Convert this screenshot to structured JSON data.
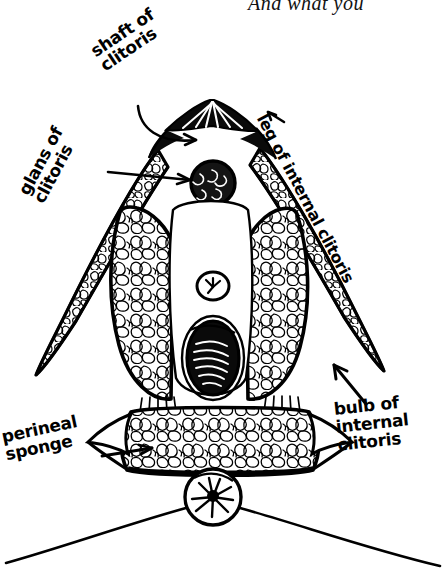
{
  "caption": {
    "text": "And what you"
  },
  "illustration": {
    "title": "internal clitoris anatomy diagram",
    "style": "hand-drawn black ink line art",
    "background_color": "#ffffff",
    "ink_color": "#000000"
  },
  "labels": [
    {
      "id": "shaft",
      "text": "shaft of\nclitoris",
      "pointer": "curved-line-arrow",
      "points_to": "clitoral shaft at apex"
    },
    {
      "id": "glans",
      "text": "glans of\nclitoris",
      "pointer": "straight-line-arrow",
      "points_to": "glans blob"
    },
    {
      "id": "leg",
      "text": "leg of internal clitoris",
      "pointer": "short-arrow",
      "points_to": "crus / leg"
    },
    {
      "id": "bulb",
      "text": "bulb of\ninternal\nclitoris",
      "pointer": "diagonal-arrow",
      "points_to": "vestibular bulb"
    },
    {
      "id": "perineal",
      "text": "perineal\nsponge",
      "pointer": "horizontal-arrow",
      "points_to": "perineal sponge band"
    }
  ],
  "structures": [
    {
      "id": "shaft",
      "name": "clitoral shaft"
    },
    {
      "id": "glans",
      "name": "glans of clitoris"
    },
    {
      "id": "leg-left",
      "name": "left leg (crus) of internal clitoris"
    },
    {
      "id": "leg-right",
      "name": "right leg (crus) of internal clitoris"
    },
    {
      "id": "bulb-left",
      "name": "left bulb of internal clitoris"
    },
    {
      "id": "bulb-right",
      "name": "right bulb of internal clitoris"
    },
    {
      "id": "urethral-opening",
      "name": "urethral opening"
    },
    {
      "id": "vaginal-opening",
      "name": "vaginal opening"
    },
    {
      "id": "perineal-sponge",
      "name": "perineal sponge"
    },
    {
      "id": "anus",
      "name": "anus"
    },
    {
      "id": "buttock-curve",
      "name": "buttock contour line"
    }
  ]
}
